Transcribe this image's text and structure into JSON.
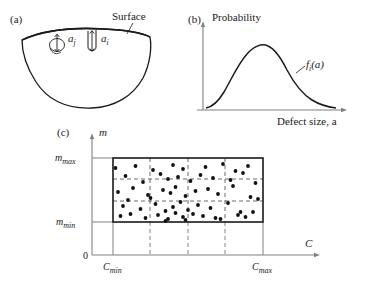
{
  "figure": {
    "panels": [
      {
        "id": "a",
        "label": "(a)",
        "caption_label": "Surface",
        "defects": [
          {
            "name": "embedded-defect",
            "label_base": "a",
            "label_sub": "j"
          },
          {
            "name": "surface-defect",
            "label_base": "a",
            "label_sub": "i"
          }
        ]
      },
      {
        "id": "b",
        "label": "(b)",
        "yaxis_label": "Probability",
        "xaxis_label": "Defect size, a",
        "curve_label_base": "f",
        "curve_label_sub": "i",
        "curve_label_tail": "(a)"
      },
      {
        "id": "c",
        "label": "(c)",
        "yaxis_label": "m",
        "xaxis_label": "C",
        "origin_label": "0",
        "y_ticks": [
          {
            "base": "m",
            "sub": "max"
          },
          {
            "base": "m",
            "sub": "min"
          }
        ],
        "x_ticks": [
          {
            "base": "C",
            "sub": "min"
          },
          {
            "base": "C",
            "sub": "max"
          }
        ]
      }
    ]
  },
  "colors": {
    "line": "#1a1a1a",
    "axis_grey": "#808080",
    "dot": "#111111",
    "background": "#ffffff"
  },
  "chart_data": [
    {
      "type": "line",
      "panel": "b",
      "title": "",
      "xlabel": "Defect size, a",
      "ylabel": "Probability",
      "legend": [
        "f_i(a)"
      ],
      "grid": false,
      "xlim": [
        0,
        100
      ],
      "ylim": [
        0,
        100
      ],
      "x": [
        0,
        5,
        12,
        20,
        28,
        36,
        44,
        52,
        58,
        64,
        70,
        78,
        86,
        94,
        100
      ],
      "y": [
        2,
        5,
        14,
        30,
        50,
        70,
        85,
        93,
        95,
        92,
        84,
        68,
        48,
        32,
        24
      ]
    },
    {
      "type": "scatter",
      "panel": "c",
      "title": "",
      "xlabel": "C",
      "ylabel": "m",
      "grid": true,
      "grid_style": "dashed",
      "xlim": [
        0,
        100
      ],
      "ylim": [
        0,
        100
      ],
      "box": {
        "xmin": 22,
        "xmax": 82,
        "ymin": 18,
        "ymax": 82
      },
      "x_gridlines": [
        37,
        52,
        67
      ],
      "y_gridlines": [
        39,
        61
      ],
      "points_x": [
        23,
        31,
        38,
        46,
        50,
        59,
        66,
        71,
        76,
        27,
        34,
        41,
        44,
        48,
        53,
        57,
        62,
        69,
        74,
        79,
        24,
        30,
        36,
        42,
        45,
        47,
        51,
        55,
        60,
        64,
        70,
        77,
        26,
        33,
        39,
        43,
        46,
        49,
        52,
        56,
        61,
        68,
        73,
        80,
        25,
        29,
        35,
        40,
        44,
        47,
        50,
        54,
        58,
        63,
        72,
        78,
        28,
        37,
        43,
        51,
        65,
        75
      ],
      "points_y": [
        72,
        74,
        70,
        75,
        71,
        73,
        76,
        69,
        74,
        64,
        58,
        66,
        61,
        63,
        59,
        65,
        62,
        60,
        67,
        57,
        48,
        52,
        45,
        50,
        47,
        53,
        44,
        49,
        51,
        46,
        54,
        43,
        34,
        31,
        36,
        29,
        33,
        38,
        30,
        35,
        32,
        37,
        28,
        41,
        24,
        26,
        22,
        25,
        21,
        27,
        23,
        26,
        24,
        22,
        25,
        28,
        40,
        42,
        19,
        20,
        21,
        23
      ]
    }
  ]
}
